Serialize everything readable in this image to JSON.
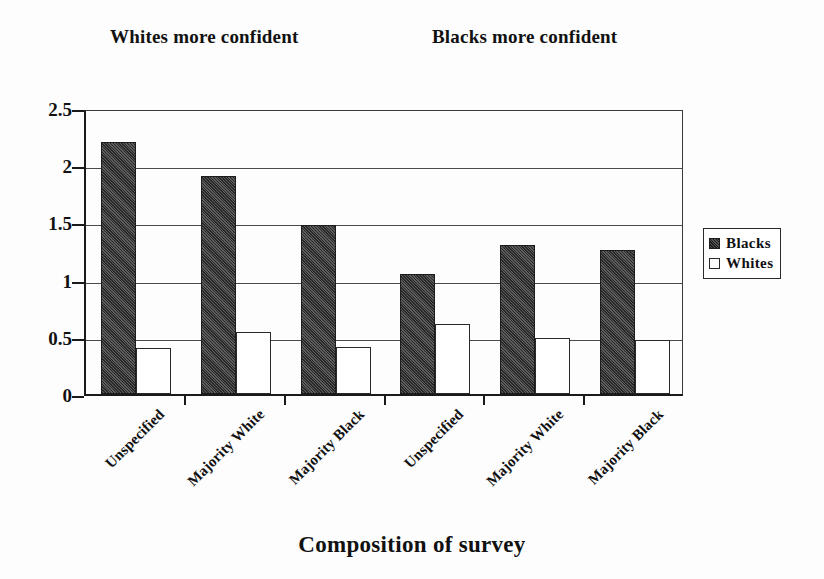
{
  "chart_data": {
    "type": "bar",
    "title": "",
    "xlabel": "Composition of survey",
    "ylabel": "",
    "ylim": [
      0,
      2.5
    ],
    "ytick_labels": [
      "2.5",
      "2",
      "1.5",
      "1",
      "0.5",
      "0"
    ],
    "ytick_values": [
      2.5,
      2,
      1.5,
      1,
      0.5,
      0
    ],
    "grid": true,
    "legend_position": "right",
    "categories": [
      "Unspecified",
      "Majority White",
      "Majority Black",
      "Unspecified",
      "Majority White",
      "Majority Black"
    ],
    "series": [
      {
        "name": "Blacks",
        "color": "#4a4a4a",
        "values": [
          2.2,
          1.91,
          1.48,
          1.05,
          1.3,
          1.26
        ]
      },
      {
        "name": "Whites",
        "color": "#ffffff",
        "values": [
          0.4,
          0.54,
          0.41,
          0.61,
          0.49,
          0.47
        ]
      }
    ],
    "annotations": [
      {
        "text": "Whites more confident",
        "position": "top-left"
      },
      {
        "text": "Blacks more confident",
        "position": "top-right"
      }
    ]
  },
  "captions": {
    "left": "Whites more confident",
    "right": "Blacks more confident"
  },
  "legend": {
    "items": [
      {
        "label": "Blacks",
        "swatch": "filled-dark-square"
      },
      {
        "label": "Whites",
        "swatch": "open-white-square"
      }
    ]
  },
  "axis": {
    "x_title": "Composition of survey"
  }
}
